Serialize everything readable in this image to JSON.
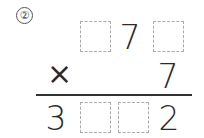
{
  "problem": {
    "number_label": "②",
    "multiplicand": [
      "",
      "7",
      ""
    ],
    "operator": "×",
    "multiplier": "7",
    "product": [
      "3",
      "",
      "",
      "2"
    ]
  }
}
